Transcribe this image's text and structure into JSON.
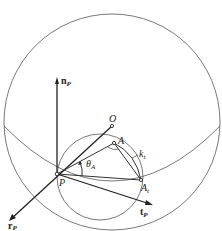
{
  "figure": {
    "labels": {
      "n_axis": {
        "main": "n",
        "sub": "P"
      },
      "t_axis": {
        "main": "t",
        "sub": "P"
      },
      "r_axis": {
        "main": "r",
        "sub": "P"
      },
      "center": "O",
      "point_P": "P",
      "point_A": "A",
      "point_At": {
        "main": "A",
        "sub": "t"
      },
      "curve_kt": {
        "main": "k",
        "sub": "t"
      },
      "angle": {
        "main": "θ",
        "sub": "A"
      }
    },
    "colors": {
      "stroke": "#222222",
      "background": "#ffffff"
    }
  }
}
